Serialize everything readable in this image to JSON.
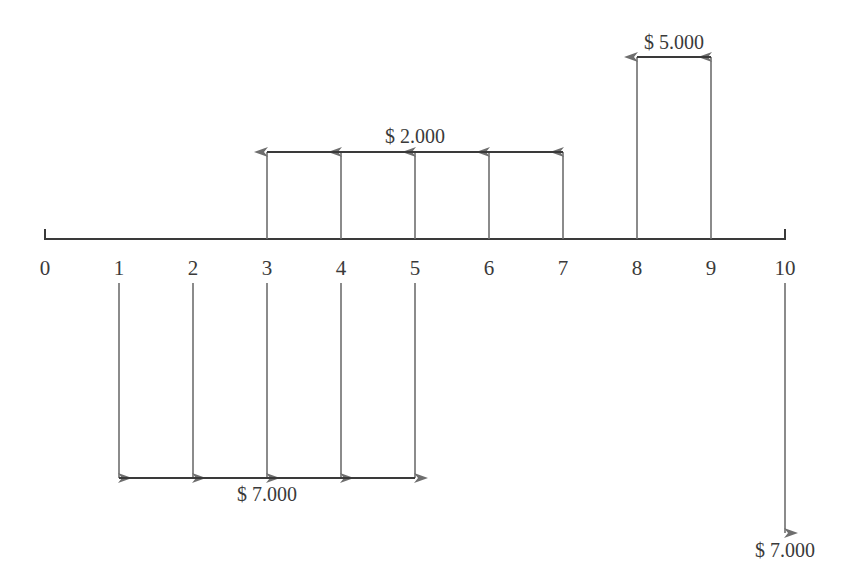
{
  "diagram": {
    "type": "cash-flow-timeline",
    "colors": {
      "axis": "#3a3a3a",
      "arrow": "#6e6e6e",
      "text": "#3a3a3a",
      "background": "#ffffff"
    },
    "axis": {
      "periods": [
        "0",
        "1",
        "2",
        "3",
        "4",
        "5",
        "6",
        "7",
        "8",
        "9",
        "10"
      ]
    },
    "flows": [
      {
        "label": "$ 2.000",
        "direction": "up",
        "periods": [
          3,
          4,
          5,
          6,
          7
        ]
      },
      {
        "label": "$ 5.000",
        "direction": "up",
        "periods": [
          8,
          9
        ]
      },
      {
        "label": "$ 7.000",
        "direction": "down",
        "periods": [
          1,
          2,
          3,
          4,
          5
        ]
      },
      {
        "label": "$ 7.000",
        "direction": "down",
        "periods": [
          10
        ]
      }
    ]
  },
  "chart_data": {
    "type": "cash-flow diagram",
    "title": "",
    "x": [
      0,
      1,
      2,
      3,
      4,
      5,
      6,
      7,
      8,
      9,
      10
    ],
    "xlabel": "period",
    "series": [
      {
        "name": "Inflows",
        "values": [
          0,
          0,
          0,
          2000,
          2000,
          2000,
          2000,
          2000,
          5000,
          5000,
          0
        ]
      },
      {
        "name": "Outflows",
        "values": [
          0,
          7000,
          7000,
          7000,
          7000,
          7000,
          0,
          0,
          0,
          0,
          7000
        ]
      }
    ],
    "annotations": [
      "$ 2.000",
      "$ 5.000",
      "$ 7.000",
      "$ 7.000"
    ]
  }
}
